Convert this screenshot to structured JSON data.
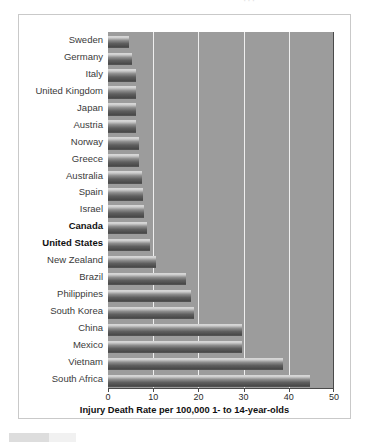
{
  "top_ghost_text": "···",
  "chart_data": {
    "type": "bar",
    "orientation": "horizontal",
    "title": "",
    "subtitle": "",
    "xlabel": "Injury Death Rate per 100,000 1- to 14-year-olds",
    "ylabel": "",
    "xlim": [
      0,
      50
    ],
    "xticks": [
      0,
      10,
      20,
      30,
      40,
      50
    ],
    "xticklabels": [
      "0",
      "10",
      "20",
      "30",
      "40",
      "50"
    ],
    "grid": "vertical gridlines at 10, 20, 30, 40",
    "legend": "none",
    "plot_background": "#9c9c9c",
    "bar_color_top": "#d9d9d9",
    "bar_color_bottom": "#4a4a4a",
    "categories": [
      "Sweden",
      "Germany",
      "Italy",
      "United Kingdom",
      "Japan",
      "Austria",
      "Norway",
      "Greece",
      "Australia",
      "Spain",
      "Israel",
      "Canada",
      "United States",
      "New Zealand",
      "Brazil",
      "Philippines",
      "South Korea",
      "China",
      "Mexico",
      "Vietnam",
      "South Africa"
    ],
    "values": [
      4.6,
      5.4,
      6.1,
      6.1,
      6.2,
      6.3,
      6.8,
      6.9,
      7.6,
      7.8,
      7.9,
      8.6,
      9.3,
      10.7,
      17.3,
      18.4,
      19.1,
      29.6,
      29.7,
      38.7,
      44.8
    ],
    "highlighted": [
      "Canada",
      "United States"
    ]
  },
  "artifact": {
    "present": true
  }
}
